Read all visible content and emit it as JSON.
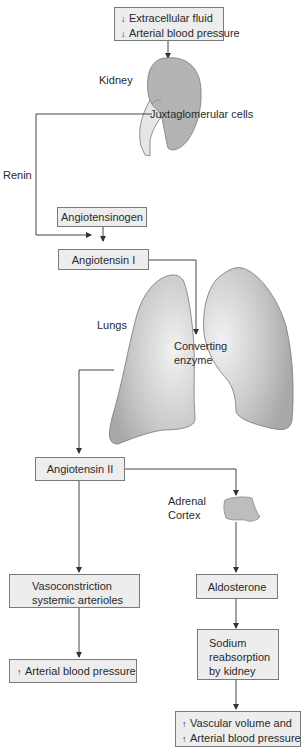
{
  "top_box": {
    "line1_arrow": "↓",
    "line1": "Extracellular fluid",
    "line2_arrow": "↓",
    "line2": "Arterial blood pressure"
  },
  "labels": {
    "kidney": "Kidney",
    "juxtaglomerular": "Juxtaglomerular cells",
    "renin": "Renin",
    "lungs": "Lungs",
    "converting_line1": "Converting",
    "converting_line2": "enzyme",
    "adrenal_line1": "Adrenal",
    "adrenal_line2": "Cortex"
  },
  "boxes": {
    "angiotensinogen": "Angiotensinogen",
    "angiotensin_1": "Angiotensin I",
    "angiotensin_2": "Angiotensin II",
    "vasoconstriction_line1": "Vasoconstriction",
    "vasoconstriction_line2": "systemic arterioles",
    "aldosterone": "Aldosterone",
    "sodium_line1": "Sodium",
    "sodium_line2": "reabsorption",
    "sodium_line3": "by kidney",
    "left_result_arrow": "↑",
    "left_result": "Arterial blood pressure",
    "right_result_arrow1": "↑",
    "right_result1": "Vascular volume and",
    "right_result_arrow2": "↑",
    "right_result2": "Arterial blood pressure"
  },
  "colors": {
    "box_fill": "#ededed",
    "box_border": "#7a7a7a",
    "organ_fill": "#b4b4b4",
    "line": "#555555"
  }
}
